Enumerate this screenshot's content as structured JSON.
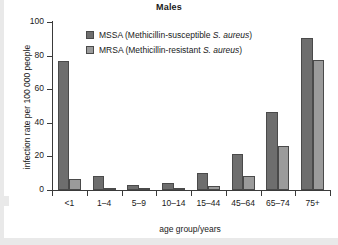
{
  "chart_data": {
    "type": "bar",
    "title": "Males",
    "xlabel": "age group/years",
    "ylabel": "infection rate per 100 000 people",
    "categories": [
      "<1",
      "1–4",
      "5–9",
      "10–14",
      "15–44",
      "45–64",
      "65–74",
      "75+"
    ],
    "series": [
      {
        "name": "MSSA (Methicillin-susceptible S. aureus)",
        "short": "MSSA",
        "color": "#6e6e6e",
        "values": [
          77,
          8.5,
          3,
          4.3,
          10.2,
          21.3,
          46.5,
          90.6
        ]
      },
      {
        "name": "MRSA (Methicillin-resistant S. aureus)",
        "short": "MRSA",
        "color": "#9b9b9b",
        "values": [
          6.6,
          0.6,
          0.7,
          0.7,
          2.2,
          8.3,
          26,
          77.2
        ]
      }
    ],
    "ylim": [
      0,
      100
    ],
    "yticks": [
      0,
      20,
      40,
      60,
      80,
      100
    ],
    "grid": false,
    "legend_position": "top-center"
  },
  "legend": {
    "entries": [
      {
        "code": "MSSA",
        "open": " (Methicillin-susceptible ",
        "italic": "S. aureus",
        "close": ")"
      },
      {
        "code": "MRSA",
        "open": " (Methicillin-resistant ",
        "italic": "S. aureus",
        "close": ")"
      }
    ]
  }
}
